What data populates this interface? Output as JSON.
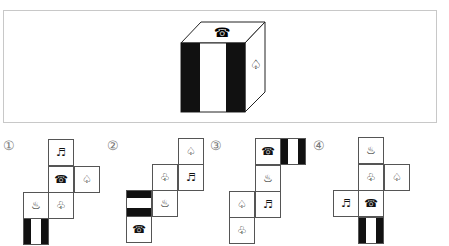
{
  "cube": {
    "top_symbol": "☎",
    "right_symbol": "♤",
    "front_pattern": "vertical-stripes"
  },
  "options": [
    {
      "label": "①",
      "cells": [
        {
          "row": 0,
          "col": 1,
          "symbol": "♬"
        },
        {
          "row": 1,
          "col": 1,
          "symbol": "☎"
        },
        {
          "row": 1,
          "col": 2,
          "symbol": "♤"
        },
        {
          "row": 2,
          "col": 0,
          "symbol": "♨"
        },
        {
          "row": 2,
          "col": 1,
          "symbol": "♧"
        },
        {
          "row": 3,
          "col": 0,
          "pattern": "vertical-stripes"
        }
      ]
    },
    {
      "label": "②",
      "cells": [
        {
          "row": 0,
          "col": 2,
          "symbol": "♤"
        },
        {
          "row": 1,
          "col": 1,
          "symbol": "♧"
        },
        {
          "row": 1,
          "col": 2,
          "symbol": "♬"
        },
        {
          "row": 2,
          "col": 0,
          "pattern": "horizontal-stripes"
        },
        {
          "row": 2,
          "col": 1,
          "symbol": "♨"
        },
        {
          "row": 3,
          "col": 0,
          "symbol": "☎"
        }
      ]
    },
    {
      "label": "③",
      "cells": [
        {
          "row": 0,
          "col": 1,
          "symbol": "☎"
        },
        {
          "row": 0,
          "col": 2,
          "pattern": "vertical-stripes"
        },
        {
          "row": 1,
          "col": 1,
          "symbol": "♨"
        },
        {
          "row": 2,
          "col": 0,
          "symbol": "♤"
        },
        {
          "row": 2,
          "col": 1,
          "symbol": "♬"
        },
        {
          "row": 3,
          "col": 0,
          "symbol": "♧"
        }
      ]
    },
    {
      "label": "④",
      "cells": [
        {
          "row": 0,
          "col": 1,
          "symbol": "♨"
        },
        {
          "row": 1,
          "col": 1,
          "symbol": "♧"
        },
        {
          "row": 1,
          "col": 2,
          "symbol": "♤"
        },
        {
          "row": 2,
          "col": 0,
          "symbol": "♬"
        },
        {
          "row": 2,
          "col": 1,
          "symbol": "☎"
        },
        {
          "row": 3,
          "col": 1,
          "pattern": "vertical-stripes"
        }
      ]
    }
  ]
}
